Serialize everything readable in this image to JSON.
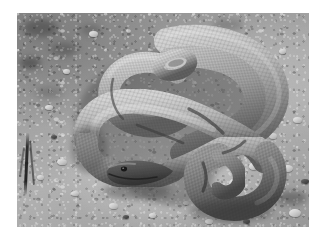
{
  "page": {
    "background_color": "#ffffff",
    "width": 309,
    "height": 245
  },
  "photo": {
    "subject": "snake",
    "description": "Grayscale photograph of a large coiled snake resting on dry gravelly sand",
    "orientation": "landscape",
    "color_mode": "grayscale",
    "frame": {
      "x": 17,
      "y": 13,
      "width": 292,
      "height": 214
    },
    "palette": {
      "ground_light": "#cfcbc4",
      "ground_mid": "#a5a19b",
      "ground_dark": "#817e7a",
      "snake_light": "#c9c4bb",
      "snake_mid": "#9a948b",
      "snake_dark": "#4d4a45",
      "shadow": "#5c5955",
      "stone_highlight": "#ecebe6"
    },
    "elements": {
      "snake_body_label": "coiled snake body",
      "snake_head_label": "snake head",
      "snake_tail_label": "snake tail",
      "ground_label": "gravel ground",
      "twig_label": "dark twig",
      "shadow_label": "cast shadow",
      "stones_label": "scattered pebbles"
    }
  },
  "artifacts": {
    "scan_streak_label": "scanner streak"
  }
}
